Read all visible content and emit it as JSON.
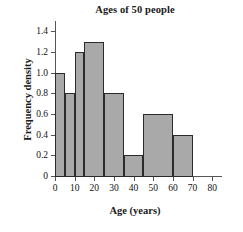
{
  "chart_data": {
    "type": "bar",
    "title": "Ages of 50 people",
    "xlabel": "Age (years)",
    "ylabel": "Frequency density",
    "grid": false,
    "legend": null,
    "xlim": [
      0,
      85
    ],
    "ylim": [
      0,
      1.5
    ],
    "xticks": [
      "0",
      "10",
      "20",
      "30",
      "40",
      "50",
      "60",
      "70",
      "80"
    ],
    "xtick_values": [
      0,
      10,
      20,
      30,
      40,
      50,
      60,
      70,
      80
    ],
    "yticks": [
      "0",
      "0.2",
      "0.4",
      "0.6",
      "0.8",
      "1.0",
      "1.2",
      "1.4"
    ],
    "ytick_values": [
      0,
      0.2,
      0.4,
      0.6,
      0.8,
      1.0,
      1.2,
      1.4
    ],
    "bar_fill_color": "#a9a9a9",
    "bar_edge_color": "#2b2b2b",
    "axis_color": "#555555",
    "bins": [
      {
        "label": "0-5",
        "x0": 0,
        "x1": 5,
        "value": 1.0,
        "frequency": 5
      },
      {
        "label": "5-10",
        "x0": 5,
        "x1": 10,
        "value": 0.8,
        "frequency": 4
      },
      {
        "label": "10-15",
        "x0": 10,
        "x1": 15,
        "value": 1.2,
        "frequency": 6
      },
      {
        "label": "15-25",
        "x0": 15,
        "x1": 25,
        "value": 1.3,
        "frequency": 13
      },
      {
        "label": "25-35",
        "x0": 25,
        "x1": 35,
        "value": 0.8,
        "frequency": 8
      },
      {
        "label": "35-45",
        "x0": 35,
        "x1": 45,
        "value": 0.2,
        "frequency": 2
      },
      {
        "label": "45-60",
        "x0": 45,
        "x1": 60,
        "value": 0.6,
        "frequency": 9
      },
      {
        "label": "60-70",
        "x0": 60,
        "x1": 70,
        "value": 0.4,
        "frequency": 4
      }
    ],
    "categories": [
      "0-5",
      "5-10",
      "10-15",
      "15-25",
      "25-35",
      "35-45",
      "45-60",
      "60-70"
    ],
    "values": [
      1.0,
      0.8,
      1.2,
      1.3,
      0.8,
      0.2,
      0.6,
      0.4
    ]
  }
}
